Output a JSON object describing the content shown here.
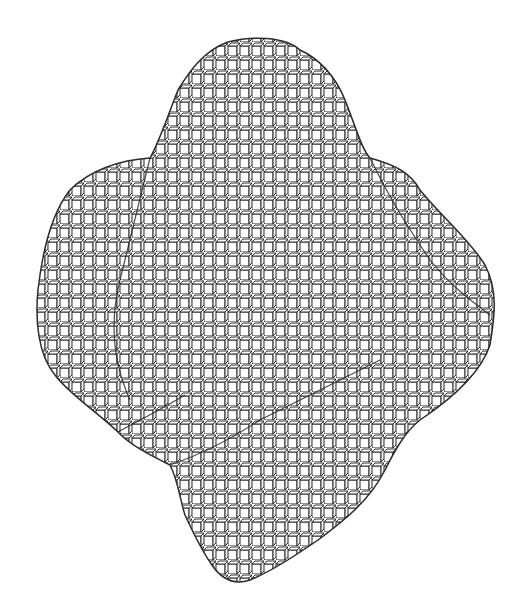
{
  "figure": {
    "background_color": "#ffffff",
    "line_color": "#2a2a2a",
    "face_color": "#ffffff",
    "lobes": [
      "top",
      "left",
      "right",
      "bottom",
      "front-center"
    ]
  }
}
